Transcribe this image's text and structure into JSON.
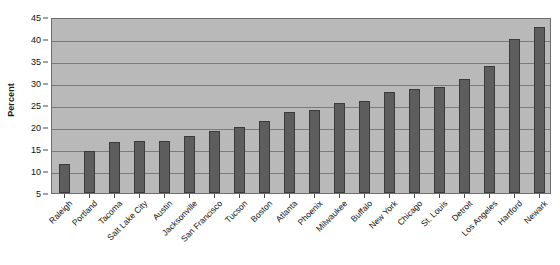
{
  "chart_data": {
    "type": "bar",
    "title": "",
    "xlabel": "",
    "ylabel": "Percent",
    "ylim": [
      5,
      45
    ],
    "ytick_step": 5,
    "yticks": [
      5,
      10,
      15,
      20,
      25,
      30,
      35,
      40,
      45
    ],
    "grid": true,
    "legend": "none",
    "categories": [
      "Raleigh",
      "Portland",
      "Tacoma",
      "Salt Lake City",
      "Austin",
      "Jacksonville",
      "San Francisco",
      "Tucson",
      "Boston",
      "Atlanta",
      "Phoenix",
      "Milwaukee",
      "Buffalo",
      "New York",
      "Chicago",
      "St. Louis",
      "Detroit",
      "Los Angeles",
      "Hartford",
      "Newark"
    ],
    "values": [
      11.6,
      14.5,
      16.5,
      16.8,
      16.8,
      17.9,
      19.1,
      20.1,
      21.3,
      23.4,
      23.8,
      25.5,
      25.8,
      28.0,
      28.7,
      29.1,
      30.8,
      33.8,
      40.0,
      42.7
    ]
  },
  "colors": {
    "bar_fill": "#5d5d5d",
    "bar_border": "#3b3b3b",
    "plot_background": "#b9b9b9",
    "gridline": "#7a7a7a",
    "frame_border": "#6e6e6e",
    "page_background": "#ffffff",
    "text": "#111111"
  }
}
